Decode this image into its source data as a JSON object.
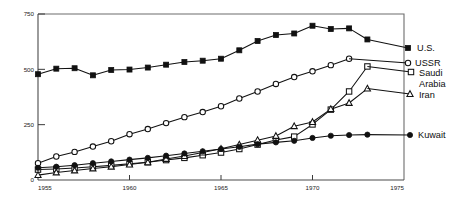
{
  "chart_data": {
    "type": "line",
    "title": "",
    "subtitle": "",
    "xlabel": "",
    "ylabel": "",
    "xlim": [
      1955,
      1975
    ],
    "ylim": [
      0,
      750
    ],
    "grid": false,
    "legend_position": "right-inline",
    "x_ticks": [
      "1955",
      "1960",
      "1965",
      "1970",
      "1975"
    ],
    "x_tick_values": [
      1955,
      1960,
      1965,
      1970,
      1975
    ],
    "y_ticks": [
      "0",
      "250",
      "500",
      "750"
    ],
    "y_tick_values": [
      0,
      250,
      500,
      750
    ],
    "x": [
      1955,
      1956,
      1957,
      1958,
      1959,
      1960,
      1961,
      1962,
      1963,
      1964,
      1965,
      1966,
      1967,
      1968,
      1969,
      1970,
      1971,
      1972,
      1973
    ],
    "series": [
      {
        "name": "U.S.",
        "marker": "filled-square",
        "values": [
          478,
          503,
          505,
          473,
          497,
          499,
          508,
          521,
          533,
          539,
          548,
          586,
          628,
          655,
          662,
          697,
          682,
          685,
          635
        ]
      },
      {
        "name": "USSR",
        "marker": "open-circle",
        "values": [
          76,
          106,
          127,
          151,
          175,
          207,
          230,
          257,
          284,
          307,
          333,
          368,
          400,
          434,
          465,
          491,
          519,
          548,
          null
        ]
      },
      {
        "name": "Saudi Arabia",
        "marker": "open-square",
        "values": [
          47,
          50,
          54,
          60,
          66,
          73,
          80,
          90,
          100,
          112,
          124,
          140,
          160,
          181,
          196,
          251,
          318,
          400,
          513
        ]
      },
      {
        "name": "Iran",
        "marker": "open-triangle",
        "values": [
          22,
          34,
          43,
          52,
          60,
          70,
          80,
          95,
          108,
          124,
          141,
          160,
          180,
          199,
          243,
          262,
          320,
          348,
          413
        ]
      },
      {
        "name": "Kuwait",
        "marker": "filled-circle",
        "values": [
          55,
          60,
          67,
          76,
          84,
          92,
          100,
          110,
          120,
          130,
          140,
          150,
          162,
          170,
          177,
          190,
          200,
          203,
          205
        ]
      }
    ],
    "legend": [
      {
        "label": "U.S.",
        "marker": "filled-square"
      },
      {
        "label": "USSR",
        "marker": "open-circle"
      },
      {
        "label": "Saudi",
        "marker": "open-square"
      },
      {
        "label": "Arabia",
        "marker": "none"
      },
      {
        "label": "Iran",
        "marker": "open-triangle"
      },
      {
        "label": "Kuwait",
        "marker": "filled-circle"
      }
    ],
    "colors": {
      "line": "#111111",
      "axis": "#4a4a4a",
      "frame": "#6d6d6d",
      "text": "#1a1a1a",
      "background": "#ffffff"
    }
  }
}
